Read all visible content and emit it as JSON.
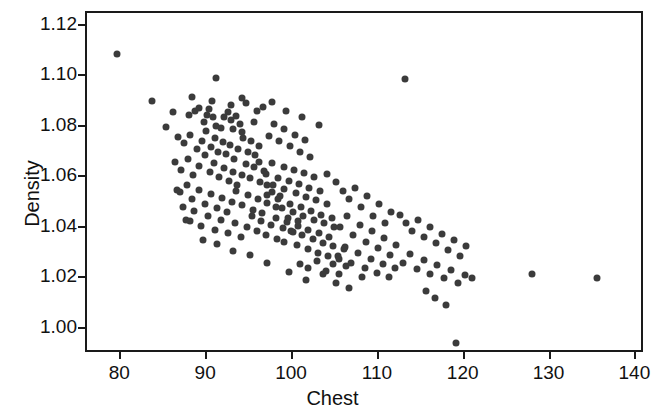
{
  "chart_data": {
    "type": "scatter",
    "title": "",
    "xlabel": "Chest",
    "ylabel": "Density",
    "xlim": [
      76,
      141
    ],
    "ylim": [
      0.99,
      1.125
    ],
    "xticks": [
      80,
      90,
      100,
      110,
      120,
      130,
      140
    ],
    "xtick_labels": [
      "80",
      "90",
      "100",
      "110",
      "120",
      "130",
      "140"
    ],
    "yticks": [
      1.0,
      1.02,
      1.04,
      1.06,
      1.08,
      1.1,
      1.12
    ],
    "ytick_labels": [
      "1.00",
      "1.02",
      "1.04",
      "1.06",
      "1.08",
      "1.10",
      "1.12"
    ],
    "grid": false,
    "legend": null,
    "marker": "filled-circle",
    "marker_color": "#3b3b3b",
    "marker_size_px": 7,
    "n_points": 250,
    "correlation": "negative",
    "points": [
      [
        79.5,
        1.1089
      ],
      [
        83.6,
        1.09
      ],
      [
        86.0,
        1.0858
      ],
      [
        89.0,
        1.0873
      ],
      [
        91.0,
        1.0991
      ],
      [
        85.2,
        1.08
      ],
      [
        87.9,
        1.0847
      ],
      [
        88.6,
        1.0862
      ],
      [
        89.6,
        1.082
      ],
      [
        90.0,
        1.0848
      ],
      [
        90.2,
        1.0871
      ],
      [
        90.7,
        1.0838
      ],
      [
        91.0,
        1.0803
      ],
      [
        91.6,
        1.0795
      ],
      [
        92.0,
        1.0838
      ],
      [
        92.4,
        1.086
      ],
      [
        92.8,
        1.0825
      ],
      [
        93.0,
        1.079
      ],
      [
        93.4,
        1.0842
      ],
      [
        93.8,
        1.081
      ],
      [
        94.0,
        1.0778
      ],
      [
        86.6,
        1.076
      ],
      [
        87.3,
        1.0735
      ],
      [
        88.0,
        1.0768
      ],
      [
        88.8,
        1.0712
      ],
      [
        89.4,
        1.0745
      ],
      [
        89.9,
        1.0782
      ],
      [
        90.4,
        1.072
      ],
      [
        90.9,
        1.0755
      ],
      [
        91.3,
        1.07
      ],
      [
        91.8,
        1.0738
      ],
      [
        92.2,
        1.069
      ],
      [
        92.6,
        1.0726
      ],
      [
        93.1,
        1.0672
      ],
      [
        93.6,
        1.071
      ],
      [
        94.2,
        1.0755
      ],
      [
        94.7,
        1.07
      ],
      [
        95.1,
        1.0742
      ],
      [
        95.6,
        1.0688
      ],
      [
        96.0,
        1.0722
      ],
      [
        86.2,
        1.066
      ],
      [
        87.0,
        1.063
      ],
      [
        87.8,
        1.0672
      ],
      [
        88.4,
        1.0608
      ],
      [
        89.1,
        1.0645
      ],
      [
        89.7,
        1.0688
      ],
      [
        90.3,
        1.062
      ],
      [
        90.8,
        1.0658
      ],
      [
        91.4,
        1.06
      ],
      [
        92.0,
        1.0638
      ],
      [
        92.5,
        1.0585
      ],
      [
        93.0,
        1.0622
      ],
      [
        93.5,
        1.057
      ],
      [
        94.0,
        1.0608
      ],
      [
        94.5,
        1.0652
      ],
      [
        95.0,
        1.0596
      ],
      [
        95.5,
        1.064
      ],
      [
        96.1,
        1.0582
      ],
      [
        96.6,
        1.0625
      ],
      [
        97.0,
        1.057
      ],
      [
        86.8,
        1.054
      ],
      [
        87.6,
        1.0568
      ],
      [
        88.2,
        1.0512
      ],
      [
        89.0,
        1.055
      ],
      [
        89.8,
        1.0495
      ],
      [
        90.5,
        1.0532
      ],
      [
        91.1,
        1.0478
      ],
      [
        91.7,
        1.0516
      ],
      [
        92.3,
        1.0462
      ],
      [
        92.9,
        1.05
      ],
      [
        93.4,
        1.0545
      ],
      [
        94.1,
        1.0488
      ],
      [
        94.8,
        1.053
      ],
      [
        95.3,
        1.0472
      ],
      [
        95.9,
        1.0515
      ],
      [
        96.4,
        1.0458
      ],
      [
        97.0,
        1.0498
      ],
      [
        97.5,
        1.054
      ],
      [
        98.0,
        1.0482
      ],
      [
        98.5,
        1.0525
      ],
      [
        87.5,
        1.043
      ],
      [
        88.5,
        1.0465
      ],
      [
        89.3,
        1.0408
      ],
      [
        90.1,
        1.0448
      ],
      [
        90.9,
        1.0392
      ],
      [
        91.6,
        1.0432
      ],
      [
        92.4,
        1.0378
      ],
      [
        93.2,
        1.0418
      ],
      [
        93.9,
        1.0362
      ],
      [
        94.6,
        1.0402
      ],
      [
        95.2,
        1.0445
      ],
      [
        95.8,
        1.0388
      ],
      [
        96.3,
        1.0428
      ],
      [
        96.9,
        1.0372
      ],
      [
        97.4,
        1.0412
      ],
      [
        98.1,
        1.0355
      ],
      [
        98.8,
        1.0398
      ],
      [
        99.4,
        1.044
      ],
      [
        100.0,
        1.0382
      ],
      [
        100.6,
        1.0425
      ],
      [
        94.5,
        1.0892
      ],
      [
        95.5,
        1.082
      ],
      [
        96.5,
        1.0878
      ],
      [
        97.2,
        1.0762
      ],
      [
        97.8,
        1.0812
      ],
      [
        98.4,
        1.0742
      ],
      [
        99.0,
        1.079
      ],
      [
        99.6,
        1.0722
      ],
      [
        100.2,
        1.0768
      ],
      [
        100.8,
        1.07
      ],
      [
        101.4,
        1.0748
      ],
      [
        102.0,
        1.068
      ],
      [
        96.0,
        1.066
      ],
      [
        96.8,
        1.0612
      ],
      [
        97.6,
        1.0655
      ],
      [
        98.2,
        1.0598
      ],
      [
        98.9,
        1.0642
      ],
      [
        99.5,
        1.0585
      ],
      [
        100.1,
        1.0628
      ],
      [
        100.7,
        1.0572
      ],
      [
        101.3,
        1.0615
      ],
      [
        101.9,
        1.0558
      ],
      [
        102.5,
        1.0602
      ],
      [
        103.1,
        1.0545
      ],
      [
        97.0,
        1.053
      ],
      [
        97.7,
        1.0568
      ],
      [
        98.3,
        1.0512
      ],
      [
        99.0,
        1.0552
      ],
      [
        99.7,
        1.0495
      ],
      [
        100.3,
        1.0538
      ],
      [
        100.9,
        1.0482
      ],
      [
        101.5,
        1.0522
      ],
      [
        102.1,
        1.0468
      ],
      [
        102.7,
        1.0508
      ],
      [
        103.3,
        1.0452
      ],
      [
        103.9,
        1.0492
      ],
      [
        98.0,
        1.0438
      ],
      [
        98.7,
        1.0478
      ],
      [
        99.3,
        1.0422
      ],
      [
        100.0,
        1.0462
      ],
      [
        100.6,
        1.0408
      ],
      [
        101.2,
        1.0448
      ],
      [
        101.8,
        1.0392
      ],
      [
        102.4,
        1.0432
      ],
      [
        103.0,
        1.0378
      ],
      [
        103.6,
        1.0418
      ],
      [
        104.2,
        1.0362
      ],
      [
        104.8,
        1.0402
      ],
      [
        99.0,
        1.0345
      ],
      [
        99.8,
        1.0385
      ],
      [
        100.5,
        1.033
      ],
      [
        101.1,
        1.037
      ],
      [
        101.7,
        1.0315
      ],
      [
        102.3,
        1.0355
      ],
      [
        102.9,
        1.03
      ],
      [
        103.5,
        1.034
      ],
      [
        104.1,
        1.0288
      ],
      [
        104.7,
        1.0328
      ],
      [
        105.3,
        1.0275
      ],
      [
        105.9,
        1.0315
      ],
      [
        100.8,
        1.0255
      ],
      [
        101.8,
        1.024
      ],
      [
        102.8,
        1.0268
      ],
      [
        103.8,
        1.0228
      ],
      [
        104.6,
        1.0258
      ],
      [
        105.4,
        1.0215
      ],
      [
        106.2,
        1.0248
      ],
      [
        104.0,
        1.0612
      ],
      [
        105.0,
        1.058
      ],
      [
        105.8,
        1.0545
      ],
      [
        106.5,
        1.0512
      ],
      [
        107.2,
        1.0558
      ],
      [
        107.9,
        1.048
      ],
      [
        108.6,
        1.0525
      ],
      [
        109.3,
        1.0448
      ],
      [
        110.0,
        1.0492
      ],
      [
        110.7,
        1.0418
      ],
      [
        111.4,
        1.0462
      ],
      [
        104.5,
        1.0438
      ],
      [
        105.5,
        1.0402
      ],
      [
        106.3,
        1.0445
      ],
      [
        107.0,
        1.0372
      ],
      [
        107.8,
        1.0412
      ],
      [
        108.5,
        1.0342
      ],
      [
        109.2,
        1.0385
      ],
      [
        109.9,
        1.0318
      ],
      [
        110.6,
        1.0358
      ],
      [
        111.3,
        1.0292
      ],
      [
        112.0,
        1.0332
      ],
      [
        105.2,
        1.0288
      ],
      [
        106.0,
        1.0322
      ],
      [
        106.8,
        1.0262
      ],
      [
        107.6,
        1.0298
      ],
      [
        108.4,
        1.0242
      ],
      [
        109.1,
        1.0278
      ],
      [
        109.8,
        1.0222
      ],
      [
        110.5,
        1.0258
      ],
      [
        111.2,
        1.0205
      ],
      [
        111.9,
        1.024
      ],
      [
        113.0,
        1.099
      ],
      [
        112.5,
        1.0452
      ],
      [
        113.2,
        1.0418
      ],
      [
        113.9,
        1.0388
      ],
      [
        114.6,
        1.0432
      ],
      [
        115.3,
        1.0362
      ],
      [
        116.0,
        1.0402
      ],
      [
        116.7,
        1.0338
      ],
      [
        117.4,
        1.0375
      ],
      [
        118.1,
        1.0312
      ],
      [
        118.8,
        1.0352
      ],
      [
        119.5,
        1.0288
      ],
      [
        120.2,
        1.0328
      ],
      [
        112.8,
        1.0262
      ],
      [
        113.6,
        1.0295
      ],
      [
        114.4,
        1.0238
      ],
      [
        115.2,
        1.0272
      ],
      [
        116.0,
        1.0218
      ],
      [
        116.8,
        1.0252
      ],
      [
        117.6,
        1.02
      ],
      [
        118.4,
        1.0232
      ],
      [
        119.2,
        1.0182
      ],
      [
        120.0,
        1.0212
      ],
      [
        120.8,
        1.0202
      ],
      [
        115.5,
        1.015
      ],
      [
        116.5,
        1.012
      ],
      [
        117.8,
        1.0095
      ],
      [
        119.0,
        0.9942
      ],
      [
        127.8,
        1.0215
      ],
      [
        135.4,
        1.02
      ],
      [
        88.2,
        1.0918
      ],
      [
        90.6,
        1.0902
      ],
      [
        92.8,
        1.0885
      ],
      [
        94.0,
        1.0912
      ],
      [
        95.8,
        1.0862
      ],
      [
        99.2,
        1.0862
      ],
      [
        101.0,
        1.0838
      ],
      [
        103.0,
        1.0808
      ],
      [
        97.5,
        1.0898
      ],
      [
        86.5,
        1.0548
      ],
      [
        87.2,
        1.0482
      ],
      [
        88.0,
        1.0425
      ],
      [
        89.5,
        1.0352
      ],
      [
        91.2,
        1.0335
      ],
      [
        93.0,
        1.0308
      ],
      [
        95.0,
        1.0292
      ],
      [
        97.0,
        1.0262
      ],
      [
        99.5,
        1.0225
      ],
      [
        101.5,
        1.0192
      ],
      [
        103.5,
        1.0218
      ],
      [
        105.0,
        1.0182
      ],
      [
        106.5,
        1.0162
      ],
      [
        108.0,
        1.0205
      ]
    ]
  }
}
